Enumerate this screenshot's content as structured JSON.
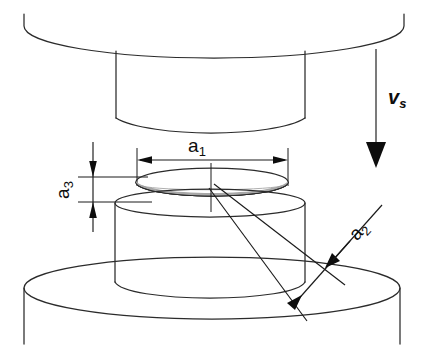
{
  "figure": {
    "type": "technical-line-drawing",
    "background_color": "#ffffff",
    "line_color": "#2b2b2b",
    "fill_color": "#a8a8a8"
  },
  "labels": {
    "a1": {
      "base": "a",
      "sub": "1",
      "full": "a1",
      "meaning": "specimen diameter",
      "rotation": 0
    },
    "a2": {
      "base": "a",
      "sub": "2",
      "full": "a2",
      "meaning": "radial gap dimension",
      "rotation": -45
    },
    "a3": {
      "base": "a",
      "sub": "3",
      "full": "a3",
      "meaning": "specimen thickness",
      "rotation": -90
    },
    "vs": {
      "base": "v",
      "sub": "s",
      "full": "vs",
      "meaning": "die travel speed",
      "rotation": 0
    }
  },
  "parts": {
    "upper_platen": "upper-platen-disk",
    "upper_punch": "upper-punch-cylinder",
    "specimen_disk": "specimen-thin-disk",
    "billet": "billet-cylinder",
    "lower_base": "lower-base-disk"
  }
}
